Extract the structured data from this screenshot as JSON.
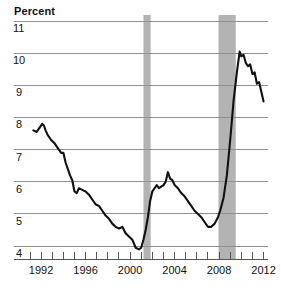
{
  "chart_data": {
    "type": "line",
    "title": "Percent",
    "xlabel": "",
    "ylabel": "Percent",
    "ylim": [
      3.6,
      11.0
    ],
    "xlim": [
      1991.0,
      2012.4
    ],
    "grid": true,
    "legend": false,
    "y_ticks": [
      "11",
      "10",
      "9",
      "8",
      "7",
      "6",
      "5",
      "4"
    ],
    "y_tick_values": [
      11,
      10,
      9,
      8,
      7,
      6,
      5,
      4
    ],
    "x_ticks": [
      "1992",
      "1996",
      "2000",
      "2004",
      "2008",
      "2012"
    ],
    "x_tick_values": [
      1992,
      1996,
      2000,
      2004,
      2008,
      2012
    ],
    "x_minor_ticks": [
      1991,
      1992,
      1993,
      1994,
      1995,
      1996,
      1997,
      1998,
      1999,
      2000,
      2001,
      2002,
      2003,
      2004,
      2005,
      2006,
      2007,
      2008,
      2009,
      2010,
      2011,
      2012
    ],
    "line_color": "#111111",
    "line_width": 2.1,
    "grid_color": "#8f8f8f",
    "shaded_color": "#b3b3b3",
    "shaded_regions": [
      {
        "name": "recession-2001",
        "x0": 2001.2,
        "x1": 2001.85
      },
      {
        "name": "recession-2008",
        "x0": 2007.95,
        "x1": 2009.5
      }
    ],
    "series": [
      {
        "name": "unemployment-rate",
        "x": [
          1991.3,
          1991.6,
          1991.9,
          1992.1,
          1992.25,
          1992.4,
          1992.6,
          1992.9,
          1993.2,
          1993.5,
          1993.8,
          1994.0,
          1994.2,
          1994.4,
          1994.6,
          1994.8,
          1995.0,
          1995.2,
          1995.4,
          1995.7,
          1996.0,
          1996.3,
          1996.6,
          1996.9,
          1997.2,
          1997.5,
          1997.8,
          1998.1,
          1998.4,
          1998.7,
          1999.0,
          1999.3,
          1999.6,
          1999.9,
          2000.2,
          2000.5,
          2000.8,
          2001.0,
          2001.2,
          2001.4,
          2001.6,
          2001.8,
          2002.0,
          2002.2,
          2002.4,
          2002.6,
          2002.8,
          2003.0,
          2003.2,
          2003.4,
          2003.6,
          2003.8,
          2004.0,
          2004.3,
          2004.6,
          2004.9,
          2005.2,
          2005.5,
          2005.8,
          2006.1,
          2006.4,
          2006.7,
          2007.0,
          2007.3,
          2007.6,
          2007.9,
          2008.1,
          2008.4,
          2008.7,
          2009.0,
          2009.3,
          2009.6,
          2009.85,
          2010.0,
          2010.2,
          2010.4,
          2010.6,
          2010.8,
          2011.0,
          2011.2,
          2011.4,
          2011.6,
          2011.8,
          2012.0
        ],
        "values": [
          7.6,
          7.55,
          7.7,
          7.8,
          7.75,
          7.6,
          7.45,
          7.3,
          7.2,
          7.05,
          6.9,
          6.9,
          6.6,
          6.4,
          6.2,
          6.05,
          5.7,
          5.65,
          5.8,
          5.75,
          5.7,
          5.6,
          5.45,
          5.3,
          5.25,
          5.1,
          4.95,
          4.85,
          4.7,
          4.6,
          4.55,
          4.6,
          4.4,
          4.3,
          4.2,
          3.95,
          3.9,
          3.95,
          4.2,
          4.5,
          4.9,
          5.4,
          5.7,
          5.8,
          5.9,
          5.8,
          5.85,
          5.9,
          6.0,
          6.3,
          6.1,
          6.05,
          5.9,
          5.8,
          5.65,
          5.55,
          5.4,
          5.25,
          5.1,
          5.0,
          4.9,
          4.75,
          4.6,
          4.6,
          4.7,
          4.9,
          5.1,
          5.5,
          6.2,
          7.3,
          8.5,
          9.4,
          10.05,
          9.9,
          9.95,
          9.7,
          9.6,
          9.65,
          9.35,
          9.4,
          9.05,
          9.1,
          8.8,
          8.5
        ]
      }
    ]
  },
  "axis_geometry": {
    "plot_left": 30,
    "plot_right": 268,
    "plot_top": 21,
    "plot_bottom": 259,
    "y_top_value": 11,
    "y_bottom_value": 3.6
  }
}
